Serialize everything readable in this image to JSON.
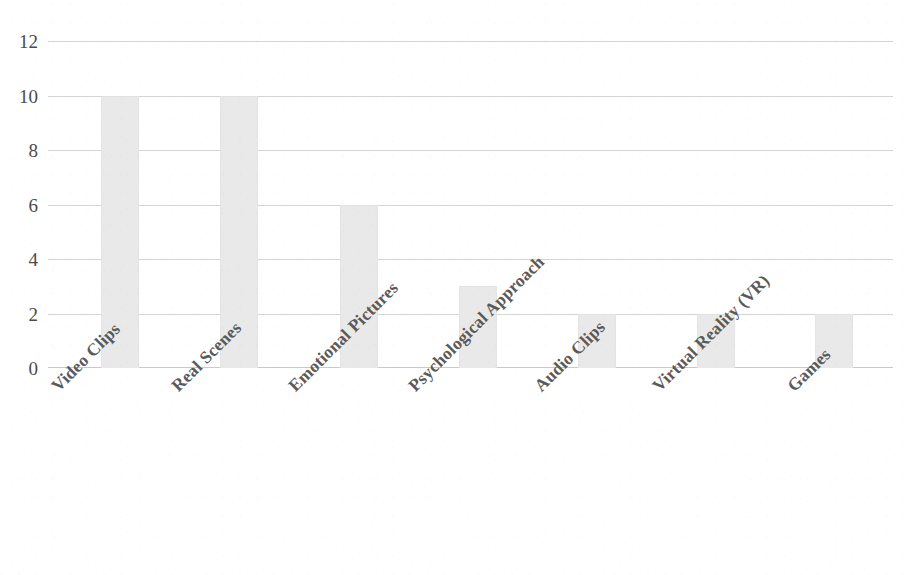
{
  "chart_data": {
    "type": "bar",
    "title": "",
    "subtitle": "",
    "xlabel": "",
    "ylabel": "",
    "categories": [
      "Video Clips",
      "Real Scenes",
      "Emotional Pictures",
      "Psychological Approach",
      "Audio Clips",
      "Virtual Reality (VR)",
      "Games"
    ],
    "values": [
      10,
      10,
      6,
      3,
      2,
      2,
      2
    ],
    "ylim": [
      0,
      12
    ],
    "ytick_labels": [
      "0",
      "2",
      "4",
      "6",
      "8",
      "10",
      "12"
    ],
    "ytick_values": [
      0,
      2,
      4,
      6,
      8,
      10,
      12
    ],
    "grid": true,
    "grid_axis": "y",
    "legend": false,
    "legend_position": "none",
    "bar_color": "#e9e9e9",
    "grid_color": "#d4d4d4",
    "axis_text_color": "#4b4b4b",
    "category_label_color": "#5a5a5a",
    "category_label_rotation": -45,
    "background_color": "#ffffff"
  },
  "figure": {
    "name": "elicitation-method-frequency-bar-chart"
  }
}
